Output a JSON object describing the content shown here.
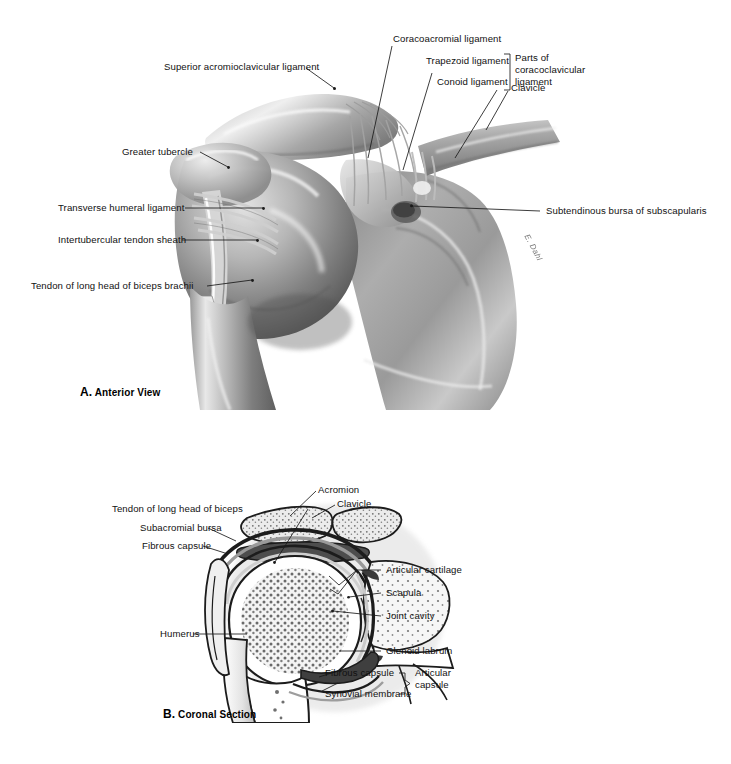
{
  "figure": {
    "ink": "#111111",
    "background": "#ffffff"
  },
  "panel_a": {
    "caption_letter": "A.",
    "caption_text": "Anterior View",
    "labels": [
      {
        "id": "superior-acromioclavicular-ligament",
        "text": "Superior acromioclavicular ligament"
      },
      {
        "id": "coracoacromial-ligament",
        "text": "Coracoacromial ligament"
      },
      {
        "id": "trapezoid-ligament",
        "text": "Trapezoid ligament"
      },
      {
        "id": "conoid-ligament",
        "text": "Conoid ligament"
      },
      {
        "id": "parts-of-coracoclavicular-ligament",
        "text": "Parts of coracoclavicular ligament"
      },
      {
        "id": "clavicle",
        "text": "Clavicle"
      },
      {
        "id": "greater-tubercle",
        "text": "Greater tubercle"
      },
      {
        "id": "transverse-humeral-ligament",
        "text": "Transverse humeral ligament"
      },
      {
        "id": "intertubercular-tendon-sheath",
        "text": "Intertubercular tendon sheath"
      },
      {
        "id": "tendon-of-long-head-of-biceps-brachii",
        "text": "Tendon of long head of biceps brachii"
      },
      {
        "id": "subtendinous-bursa-of-subscapularis",
        "text": "Subtendinous bursa of subscapularis"
      }
    ],
    "bracket_group_line1": "Parts of",
    "bracket_group_line2": "coracoclavicular",
    "bracket_group_line3": "ligament"
  },
  "panel_b": {
    "caption_letter": "B.",
    "caption_text": "Coronal Section",
    "labels": [
      {
        "id": "tendon-of-long-head-of-biceps",
        "text": "Tendon of long head of biceps"
      },
      {
        "id": "subacromial-bursa",
        "text": "Subacromial bursa"
      },
      {
        "id": "fibrous-capsule-upper",
        "text": "Fibrous capsule"
      },
      {
        "id": "acromion",
        "text": "Acromion"
      },
      {
        "id": "clavicle",
        "text": "Clavicle"
      },
      {
        "id": "articular-cartilage",
        "text": "Articular cartilage"
      },
      {
        "id": "scapula",
        "text": "Scapula"
      },
      {
        "id": "joint-cavity",
        "text": "Joint cavity"
      },
      {
        "id": "glenoid-labrum",
        "text": "Glenoid labrum"
      },
      {
        "id": "humerus",
        "text": "Humerus"
      },
      {
        "id": "fibrous-capsule-lower",
        "text": "Fibrous capsule"
      },
      {
        "id": "synovial-membrane",
        "text": "Synovial membrane"
      }
    ],
    "bracket_group_line1": "Articular",
    "bracket_group_line2": "capsule"
  },
  "artist_signature": "E. Dahl"
}
